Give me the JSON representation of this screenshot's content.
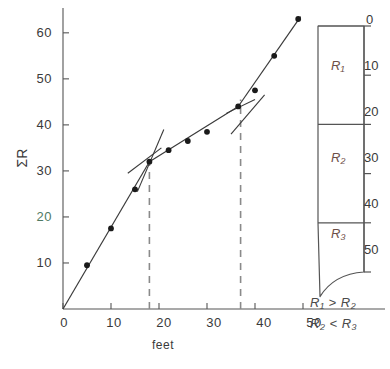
{
  "figure": {
    "kind": "scatter-with-fitted-segments-and-stratigraphic-column"
  },
  "chart_data": {
    "type": "scatter",
    "title": "",
    "xlabel": "feet",
    "ylabel": "ΣR",
    "xlim": [
      0,
      52
    ],
    "ylim": [
      0,
      66
    ],
    "xticks": [
      0,
      10,
      20,
      30,
      40,
      50
    ],
    "xticklabels": [
      "0",
      "10",
      "20",
      "30",
      "40",
      "50"
    ],
    "yticks": [
      10,
      20,
      30,
      40,
      50,
      60
    ],
    "yticklabels": [
      "10",
      "20",
      "30",
      "40",
      "50",
      "60"
    ],
    "grid": false,
    "legend": null,
    "points_x": [
      0,
      5,
      10,
      15,
      18,
      22,
      26,
      30,
      36.5,
      40,
      44,
      49
    ],
    "points_y": [
      0,
      9.5,
      17.5,
      26,
      32,
      34.5,
      36.5,
      38.5,
      44,
      47.5,
      55,
      63
    ],
    "series": [
      {
        "name": "cumulative resistance data",
        "x": [
          0,
          5,
          10,
          15,
          18,
          22,
          26,
          30,
          36.5,
          40,
          44,
          49
        ],
        "values": [
          0,
          9.5,
          17.5,
          26,
          32,
          34.5,
          36.5,
          38.5,
          44,
          47.5,
          55,
          63
        ]
      }
    ],
    "fitted_segments": [
      {
        "name": "segment-1",
        "x": [
          0,
          18
        ],
        "y": [
          0,
          32
        ],
        "slope": 1.78
      },
      {
        "name": "segment-2",
        "x": [
          18,
          36.5
        ],
        "y": [
          32,
          44
        ],
        "slope": 0.65
      },
      {
        "name": "segment-3",
        "x": [
          36.5,
          49.5
        ],
        "y": [
          44,
          63.5
        ],
        "slope": 1.5
      }
    ],
    "tangent_guides": [
      {
        "name": "tangent-upper-at-first-break",
        "x": [
          15.5,
          21
        ],
        "y": [
          25.5,
          39
        ]
      },
      {
        "name": "tangent-lower-at-first-break",
        "x": [
          13.5,
          20.5
        ],
        "y": [
          29.5,
          35
        ]
      },
      {
        "name": "tangent-upper-at-second-break",
        "x": [
          35,
          42
        ],
        "y": [
          38,
          46.5
        ]
      },
      {
        "name": "tangent-lower-at-second-break",
        "x": [
          34,
          40
        ],
        "y": [
          42.5,
          45.5
        ]
      }
    ],
    "break_lines_x": [
      18,
      37
    ],
    "annotations": []
  },
  "column": {
    "title": "",
    "depth_ticks": [
      "0",
      "10",
      "20",
      "30",
      "40",
      "50"
    ],
    "depth_values": [
      0,
      10,
      20,
      30,
      40,
      50
    ],
    "layers": [
      {
        "label": "R₁",
        "top": 0,
        "bottom": 20
      },
      {
        "label": "R₂",
        "top": 20,
        "bottom": 40
      },
      {
        "label": "R₃",
        "top": 40,
        "bottom": 50
      }
    ],
    "relations": [
      "R₁ > R₂",
      "R₂ < R₃"
    ]
  }
}
